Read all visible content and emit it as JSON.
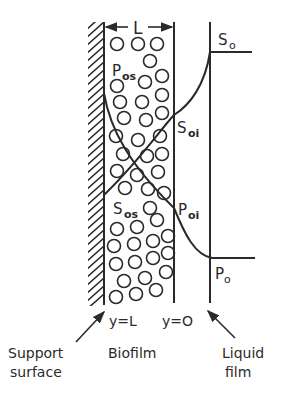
{
  "diagram": {
    "type": "biofilm concentration profile",
    "labels": {
      "thickness": "L",
      "S_bulk": "S",
      "S_bulk_sub": "o",
      "S_interface": "S",
      "S_interface_sub": "oi",
      "S_surface": "S",
      "S_surface_sub": "os",
      "P_bulk": "P",
      "P_bulk_sub": "o",
      "P_interface": "P",
      "P_interface_sub": "oi",
      "P_surface": "P",
      "P_surface_sub": "os",
      "y_wall": "y=L",
      "y_interface": "y=O"
    },
    "regions": {
      "support": "Support",
      "support_line2": "surface",
      "biofilm": "Biofilm",
      "liquid": "Liquid",
      "liquid_line2": "film"
    },
    "colors": {
      "ink": "#2a2a2a",
      "background": "#ffffff"
    }
  }
}
